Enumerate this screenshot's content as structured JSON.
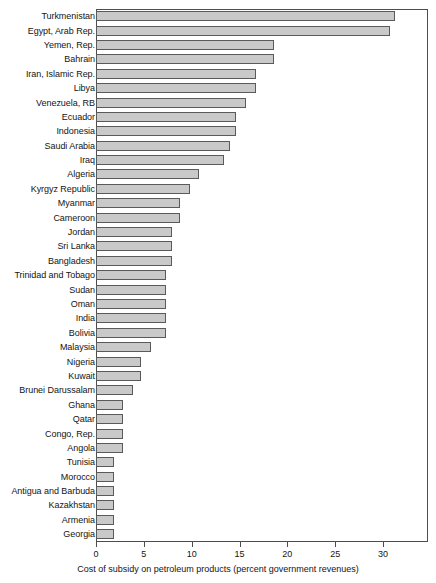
{
  "chart_data": {
    "type": "bar",
    "orientation": "horizontal",
    "title": "",
    "xlabel": "Cost of subsidy on petroleum products (percent government revenues)",
    "ylabel": "",
    "xlim": [
      0,
      34.7
    ],
    "xticks": [
      0,
      5,
      10,
      15,
      20,
      25,
      30
    ],
    "xticklabels": [
      "0",
      "5",
      "10",
      "15",
      "20",
      "25",
      "30"
    ],
    "grid": false,
    "legend": null,
    "bar_fill_color": "#c9c9c9",
    "bar_edge_color": "#5a5a5a",
    "categories": [
      "Turkmenistan",
      "Egypt, Arab Rep.",
      "Yemen, Rep.",
      "Bahrain",
      "Iran, Islamic Rep.",
      "Libya",
      "Venezuela, RB",
      "Ecuador",
      "Indonesia",
      "Saudi Arabia",
      "Iraq",
      "Algeria",
      "Kyrgyz Republic",
      "Myanmar",
      "Cameroon",
      "Jordan",
      "Sri Lanka",
      "Bangladesh",
      "Trinidad and Tobago",
      "Sudan",
      "Oman",
      "India",
      "Bolivia",
      "Malaysia",
      "Nigeria",
      "Kuwait",
      "Brunei Darussalam",
      "Ghana",
      "Qatar",
      "Congo, Rep.",
      "Angola",
      "Tunisia",
      "Morocco",
      "Antigua and Barbuda",
      "Kazakhstan",
      "Armenia",
      "Georgia"
    ],
    "values": [
      31.3,
      30.7,
      18.6,
      18.6,
      16.7,
      16.7,
      15.7,
      14.6,
      14.6,
      14.0,
      13.4,
      10.8,
      9.8,
      8.8,
      8.8,
      7.9,
      7.9,
      7.9,
      7.3,
      7.3,
      7.3,
      7.3,
      7.3,
      5.7,
      4.7,
      4.7,
      3.9,
      2.8,
      2.8,
      2.8,
      2.8,
      1.9,
      1.9,
      1.9,
      1.9,
      1.9,
      1.9
    ]
  }
}
